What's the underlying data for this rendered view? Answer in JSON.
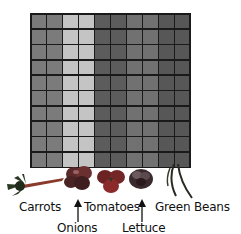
{
  "grid": {
    "rows": 10,
    "columns": 10,
    "column_groups": [
      {
        "vegetable": "Carrots",
        "columns": [
          1,
          2
        ],
        "color": "#7b7b7b"
      },
      {
        "vegetable": "Onions",
        "columns": [
          3,
          4
        ],
        "color": "#c4c4c4"
      },
      {
        "vegetable": "Tomatoes",
        "columns": [
          5,
          6
        ],
        "color": "#5c5c5c"
      },
      {
        "vegetable": "Lettuce",
        "columns": [
          7,
          8
        ],
        "color": "#717171"
      },
      {
        "vegetable": "Green Beans",
        "columns": [
          9,
          10
        ],
        "color": "#575757"
      }
    ],
    "border_color": "#1a1a1a"
  },
  "labels": {
    "carrots": "Carrots",
    "onions": "Onions",
    "tomatoes": "Tomatoes",
    "lettuce": "Lettuce",
    "green_beans": "Green Beans"
  }
}
